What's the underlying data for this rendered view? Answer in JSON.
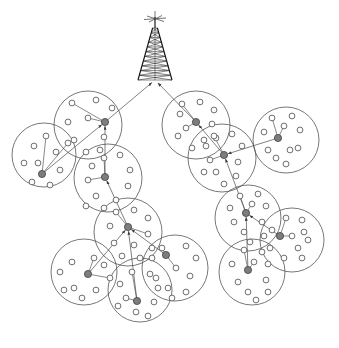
{
  "figure": {
    "caption": "",
    "background_color": "#ffffff",
    "width": 339,
    "height": 348
  },
  "legend_semantics": {
    "cluster_boundary": "circle outline = cluster coverage area",
    "sensor_node": "hollow small circle = ordinary sensor node",
    "cluster_head": "filled gray circle = cluster head",
    "hop_link": "arrow = multi-hop data forwarding path toward base station",
    "base_station": "lattice radio tower = base station / sink"
  },
  "colors": {
    "background": "#ffffff",
    "cluster_outline": "#4a4a4a",
    "node_outline": "#555555",
    "node_fill": "#ffffff",
    "head_fill": "#7d7d7d",
    "head_outline": "#333333",
    "link": "#4a4a4a",
    "tower": "#1a1a1a"
  },
  "base_station": {
    "name": "radio-tower",
    "label": "",
    "x": 155,
    "y": 80,
    "top_y": 14,
    "half_width_base": 17
  },
  "counts": {
    "clusters": 14,
    "cluster_heads": 14,
    "sensor_nodes_total": 118
  },
  "chart_data": {
    "type": "scatter",
    "xlabel": "",
    "ylabel": "",
    "xlim": [
      0,
      339
    ],
    "ylim": [
      0,
      348
    ],
    "grid": false,
    "legend_position": "none",
    "clusters": [
      {
        "id": "C1",
        "cx": 88,
        "cy": 125,
        "r": 34,
        "head": {
          "x": 105,
          "y": 122
        },
        "nodes": [
          [
            72,
            103
          ],
          [
            96,
            100
          ],
          [
            112,
            108
          ],
          [
            68,
            122
          ],
          [
            88,
            118
          ],
          [
            74,
            140
          ],
          [
            104,
            137
          ],
          [
            100,
            150
          ],
          [
            86,
            152
          ]
        ],
        "uplink_to": "base-station"
      },
      {
        "id": "C2",
        "cx": 44,
        "cy": 155,
        "r": 32,
        "head": {
          "x": 42,
          "y": 174
        },
        "nodes": [
          [
            46,
            136
          ],
          [
            34,
            146
          ],
          [
            56,
            152
          ],
          [
            38,
            163
          ],
          [
            68,
            143
          ],
          [
            24,
            163
          ],
          [
            60,
            170
          ],
          [
            50,
            185
          ],
          [
            32,
            182
          ]
        ],
        "uplink_to": "C1"
      },
      {
        "id": "C3",
        "cx": 108,
        "cy": 178,
        "r": 34,
        "head": {
          "x": 105,
          "y": 177
        },
        "nodes": [
          [
            104,
            158
          ],
          [
            120,
            155
          ],
          [
            92,
            166
          ],
          [
            130,
            170
          ],
          [
            88,
            180
          ],
          [
            128,
            186
          ],
          [
            96,
            196
          ],
          [
            116,
            200
          ],
          [
            104,
            208
          ],
          [
            86,
            206
          ]
        ],
        "uplink_to": "C1"
      },
      {
        "id": "C4",
        "cx": 128,
        "cy": 232,
        "r": 34,
        "head": {
          "x": 128,
          "y": 227
        },
        "nodes": [
          [
            116,
            212
          ],
          [
            134,
            210
          ],
          [
            148,
            218
          ],
          [
            110,
            226
          ],
          [
            148,
            234
          ],
          [
            114,
            243
          ],
          [
            134,
            245
          ],
          [
            152,
            248
          ],
          [
            122,
            256
          ],
          [
            140,
            258
          ]
        ],
        "uplink_to": "C3"
      },
      {
        "id": "C5",
        "cx": 84,
        "cy": 272,
        "r": 33,
        "head": {
          "x": 88,
          "y": 274
        },
        "nodes": [
          [
            94,
            258
          ],
          [
            72,
            262
          ],
          [
            104,
            265
          ],
          [
            60,
            272
          ],
          [
            110,
            278
          ],
          [
            74,
            288
          ],
          [
            96,
            290
          ],
          [
            82,
            298
          ],
          [
            64,
            290
          ]
        ],
        "uplink_to": "C4"
      },
      {
        "id": "C6",
        "cx": 175,
        "cy": 268,
        "r": 33,
        "head": {
          "x": 166,
          "y": 255
        },
        "nodes": [
          [
            162,
            248
          ],
          [
            186,
            246
          ],
          [
            152,
            258
          ],
          [
            196,
            258
          ],
          [
            176,
            268
          ],
          [
            156,
            278
          ],
          [
            190,
            276
          ],
          [
            168,
            288
          ],
          [
            186,
            292
          ],
          [
            172,
            298
          ]
        ],
        "uplink_to": "C4"
      },
      {
        "id": "C7",
        "cx": 140,
        "cy": 290,
        "r": 32,
        "head": {
          "x": 137,
          "y": 301
        },
        "nodes": [
          [
            132,
            272
          ],
          [
            150,
            274
          ],
          [
            120,
            284
          ],
          [
            158,
            288
          ],
          [
            126,
            298
          ],
          [
            154,
            302
          ],
          [
            136,
            312
          ],
          [
            118,
            306
          ],
          [
            148,
            316
          ]
        ],
        "uplink_to": "C4"
      },
      {
        "id": "C8",
        "cx": 196,
        "cy": 125,
        "r": 34,
        "head": {
          "x": 196,
          "y": 122
        },
        "nodes": [
          [
            182,
            104
          ],
          [
            200,
            102
          ],
          [
            180,
            114
          ],
          [
            214,
            110
          ],
          [
            186,
            128
          ],
          [
            212,
            124
          ],
          [
            178,
            136
          ],
          [
            204,
            140
          ],
          [
            192,
            148
          ],
          [
            216,
            138
          ]
        ],
        "uplink_to": "base-station"
      },
      {
        "id": "C9",
        "cx": 222,
        "cy": 158,
        "r": 34,
        "head": {
          "x": 224,
          "y": 155
        },
        "nodes": [
          [
            214,
            136
          ],
          [
            232,
            134
          ],
          [
            206,
            146
          ],
          [
            242,
            146
          ],
          [
            210,
            160
          ],
          [
            238,
            162
          ],
          [
            216,
            172
          ],
          [
            236,
            176
          ],
          [
            224,
            184
          ],
          [
            204,
            172
          ]
        ],
        "uplink_to": "C8"
      },
      {
        "id": "C10",
        "cx": 286,
        "cy": 140,
        "r": 33,
        "head": {
          "x": 278,
          "y": 138
        },
        "nodes": [
          [
            272,
            118
          ],
          [
            292,
            116
          ],
          [
            264,
            132
          ],
          [
            300,
            130
          ],
          [
            284,
            126
          ],
          [
            268,
            150
          ],
          [
            290,
            150
          ],
          [
            276,
            158
          ],
          [
            298,
            148
          ],
          [
            286,
            164
          ]
        ],
        "uplink_to": "C9"
      },
      {
        "id": "C11",
        "cx": 248,
        "cy": 218,
        "r": 33,
        "head": {
          "x": 246,
          "y": 213
        },
        "nodes": [
          [
            240,
            196
          ],
          [
            258,
            194
          ],
          [
            230,
            208
          ],
          [
            266,
            206
          ],
          [
            252,
            204
          ],
          [
            234,
            222
          ],
          [
            262,
            222
          ],
          [
            244,
            232
          ],
          [
            264,
            236
          ],
          [
            250,
            242
          ]
        ],
        "uplink_to": "C9"
      },
      {
        "id": "C12",
        "cx": 292,
        "cy": 240,
        "r": 32,
        "head": {
          "x": 280,
          "y": 236
        },
        "nodes": [
          [
            286,
            218
          ],
          [
            302,
            220
          ],
          [
            272,
            230
          ],
          [
            304,
            232
          ],
          [
            292,
            236
          ],
          [
            270,
            248
          ],
          [
            298,
            248
          ],
          [
            308,
            240
          ],
          [
            284,
            258
          ],
          [
            302,
            258
          ]
        ],
        "uplink_to": "C11"
      },
      {
        "id": "C13",
        "cx": 252,
        "cy": 272,
        "r": 33,
        "head": {
          "x": 248,
          "y": 270
        },
        "nodes": [
          [
            244,
            250
          ],
          [
            262,
            252
          ],
          [
            232,
            264
          ],
          [
            268,
            264
          ],
          [
            254,
            262
          ],
          [
            238,
            282
          ],
          [
            266,
            280
          ],
          [
            248,
            292
          ],
          [
            268,
            292
          ],
          [
            256,
            300
          ]
        ],
        "uplink_to": "C11"
      },
      {
        "id": "C14",
        "cx": 152,
        "cy": 177,
        "r": 0,
        "head": {
          "x": 152,
          "y": 177
        },
        "nodes": [],
        "uplink_to": ""
      }
    ],
    "links": [
      {
        "from": "C1",
        "to": "base-station",
        "arrow": true
      },
      {
        "from": "C8",
        "to": "base-station",
        "arrow": true
      },
      {
        "from": "C2",
        "to": "C1",
        "arrow": true
      },
      {
        "from": "C3",
        "to": "C1",
        "arrow": true
      },
      {
        "from": "C4",
        "to": "C3",
        "arrow": true
      },
      {
        "from": "C5",
        "to": "C4",
        "arrow": true
      },
      {
        "from": "C6",
        "to": "C4",
        "arrow": true
      },
      {
        "from": "C7",
        "to": "C4",
        "arrow": true
      },
      {
        "from": "C9",
        "to": "C8",
        "arrow": true
      },
      {
        "from": "C10",
        "to": "C9",
        "arrow": true
      },
      {
        "from": "C11",
        "to": "C9",
        "arrow": true
      },
      {
        "from": "C12",
        "to": "C11",
        "arrow": true
      },
      {
        "from": "C13",
        "to": "C11",
        "arrow": true
      }
    ]
  }
}
